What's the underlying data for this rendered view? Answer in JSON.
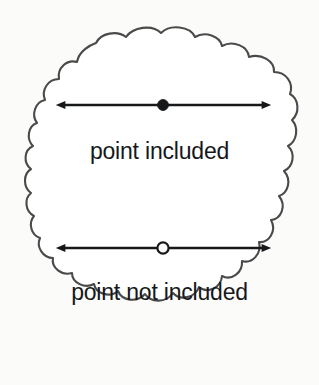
{
  "figure": {
    "type": "number-line-endpoint-notation-diagram",
    "background_color": "#fbfbfa",
    "outline_color": "#4a4a4a",
    "ink_color": "#16181a",
    "cloud": {
      "name": "cloud-outline",
      "stroke_width": 2
    },
    "items": [
      {
        "id": "included",
        "label": "point included",
        "marker": "filled-dot",
        "marker_fill": "#16181a",
        "arrow": "double-headed",
        "arrow_y": 105,
        "arrow_x_start": 65,
        "arrow_x_end": 262,
        "marker_x": 163,
        "label_y": 140
      },
      {
        "id": "not-included",
        "label": "point not included",
        "marker": "open-circle",
        "marker_fill": "#fbfbfa",
        "arrow": "double-headed",
        "arrow_y": 248,
        "arrow_x_start": 65,
        "arrow_x_end": 262,
        "marker_x": 163,
        "label_y": 281
      }
    ]
  }
}
